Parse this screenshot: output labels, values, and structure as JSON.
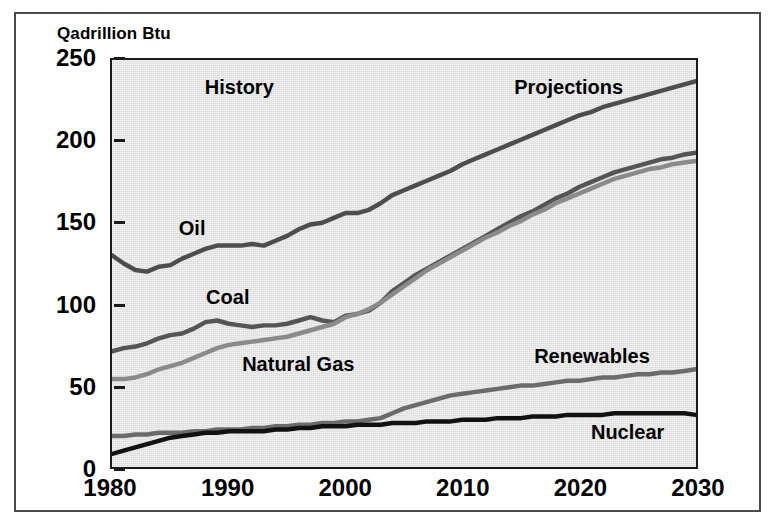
{
  "figure": {
    "axis_caption": "Qadrillion Btu"
  },
  "chart_data": {
    "type": "line",
    "title": "Qadrillion Btu",
    "xlabel": "",
    "ylabel": "Qadrillion Btu",
    "xlim": [
      1980,
      2030
    ],
    "ylim": [
      0,
      250
    ],
    "grid": false,
    "legend_position": "inline-labels",
    "xticks": [
      "1980",
      "1990",
      "2000",
      "2010",
      "2020",
      "2030"
    ],
    "xtick_values": [
      1980,
      1990,
      2000,
      2010,
      2020,
      2030
    ],
    "yticks": [
      "0",
      "50",
      "100",
      "150",
      "200",
      "250"
    ],
    "ytick_values": [
      0,
      50,
      100,
      150,
      200,
      250
    ],
    "annotations": [
      {
        "text": "History",
        "x": 1991,
        "y": 232
      },
      {
        "text": "Projections",
        "x": 2019,
        "y": 232
      },
      {
        "text": "Oil",
        "x": 1987,
        "y": 146
      },
      {
        "text": "Coal",
        "x": 1990,
        "y": 104
      },
      {
        "text": "Natural Gas",
        "x": 1996,
        "y": 63
      },
      {
        "text": "Renewables",
        "x": 2021,
        "y": 68
      },
      {
        "text": "Nuclear",
        "x": 2024,
        "y": 22
      }
    ],
    "x": [
      1980,
      1981,
      1982,
      1983,
      1984,
      1985,
      1986,
      1987,
      1988,
      1989,
      1990,
      1991,
      1992,
      1993,
      1994,
      1995,
      1996,
      1997,
      1998,
      1999,
      2000,
      2001,
      2002,
      2003,
      2004,
      2005,
      2006,
      2007,
      2008,
      2009,
      2010,
      2011,
      2012,
      2013,
      2014,
      2015,
      2016,
      2017,
      2018,
      2019,
      2020,
      2021,
      2022,
      2023,
      2024,
      2025,
      2026,
      2027,
      2028,
      2029,
      2030
    ],
    "series": [
      {
        "name": "Oil",
        "color": "#4d4d4d",
        "values": [
          130,
          125,
          121,
          120,
          123,
          124,
          128,
          131,
          134,
          136,
          136,
          136,
          137,
          136,
          139,
          142,
          146,
          149,
          150,
          153,
          156,
          156,
          158,
          162,
          167,
          170,
          173,
          176,
          179,
          182,
          186,
          189,
          192,
          195,
          198,
          201,
          204,
          207,
          210,
          213,
          216,
          218,
          221,
          223,
          225,
          227,
          229,
          231,
          233,
          235,
          237
        ]
      },
      {
        "name": "Coal",
        "color": "#555555",
        "values": [
          71,
          73,
          74,
          76,
          79,
          81,
          82,
          85,
          89,
          90,
          88,
          87,
          86,
          87,
          87,
          88,
          90,
          92,
          90,
          89,
          93,
          94,
          96,
          101,
          108,
          113,
          118,
          122,
          126,
          130,
          134,
          138,
          142,
          146,
          150,
          154,
          157,
          161,
          165,
          168,
          172,
          175,
          178,
          181,
          183,
          185,
          187,
          189,
          190,
          192,
          193
        ]
      },
      {
        "name": "Natural Gas",
        "color": "#8a8a8a",
        "values": [
          54,
          54,
          55,
          57,
          60,
          62,
          64,
          67,
          70,
          73,
          75,
          76,
          77,
          78,
          79,
          80,
          82,
          84,
          86,
          88,
          92,
          94,
          97,
          101,
          106,
          111,
          116,
          121,
          125,
          129,
          133,
          137,
          141,
          144,
          148,
          151,
          155,
          158,
          162,
          165,
          168,
          171,
          174,
          177,
          179,
          181,
          183,
          184,
          186,
          187,
          188
        ]
      },
      {
        "name": "Renewables",
        "color": "#6b6b6b",
        "values": [
          19,
          19,
          20,
          20,
          21,
          21,
          21,
          22,
          22,
          23,
          23,
          23,
          24,
          24,
          25,
          25,
          26,
          26,
          27,
          27,
          28,
          28,
          29,
          30,
          33,
          36,
          38,
          40,
          42,
          44,
          45,
          46,
          47,
          48,
          49,
          50,
          50,
          51,
          52,
          53,
          53,
          54,
          55,
          55,
          56,
          57,
          57,
          58,
          58,
          59,
          60
        ]
      },
      {
        "name": "Nuclear",
        "color": "#111111",
        "values": [
          8,
          10,
          12,
          14,
          16,
          18,
          19,
          20,
          21,
          21,
          22,
          22,
          22,
          22,
          23,
          23,
          24,
          24,
          25,
          25,
          25,
          26,
          26,
          26,
          27,
          27,
          27,
          28,
          28,
          28,
          29,
          29,
          29,
          30,
          30,
          30,
          31,
          31,
          31,
          32,
          32,
          32,
          32,
          33,
          33,
          33,
          33,
          33,
          33,
          33,
          32
        ]
      }
    ]
  }
}
